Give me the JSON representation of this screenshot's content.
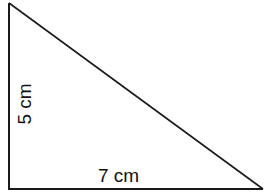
{
  "diagram": {
    "type": "right-triangle",
    "stroke_color": "#1a1a1a",
    "background": "#ffffff",
    "vertices": {
      "top": [
        9,
        3
      ],
      "bottom_left": [
        9,
        189
      ],
      "bottom_right": [
        263,
        189
      ]
    },
    "labels": {
      "height": "5 cm",
      "base": "7 cm"
    }
  }
}
